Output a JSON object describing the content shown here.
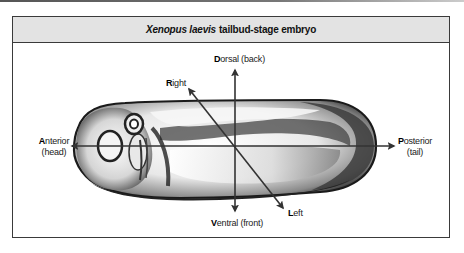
{
  "figure": {
    "title_italic": "Xenopus laevis",
    "title_rest": "tailbud-stage embryo"
  },
  "axes": {
    "dorsal": {
      "initial": "D",
      "rest": "orsal (back)"
    },
    "ventral": {
      "initial": "V",
      "rest": "entral (front)"
    },
    "anterior": {
      "initial": "A",
      "rest": "nterior",
      "sub": "(head)"
    },
    "posterior": {
      "initial": "P",
      "rest": "osterior",
      "sub": "(tail)"
    },
    "right": {
      "initial": "R",
      "rest": "ight"
    },
    "left": {
      "initial": "L",
      "rest": "eft"
    }
  },
  "colors": {
    "frame_border": "#3a3a3a",
    "header_bg": "#e3e3e3",
    "axis_line": "#333333"
  }
}
